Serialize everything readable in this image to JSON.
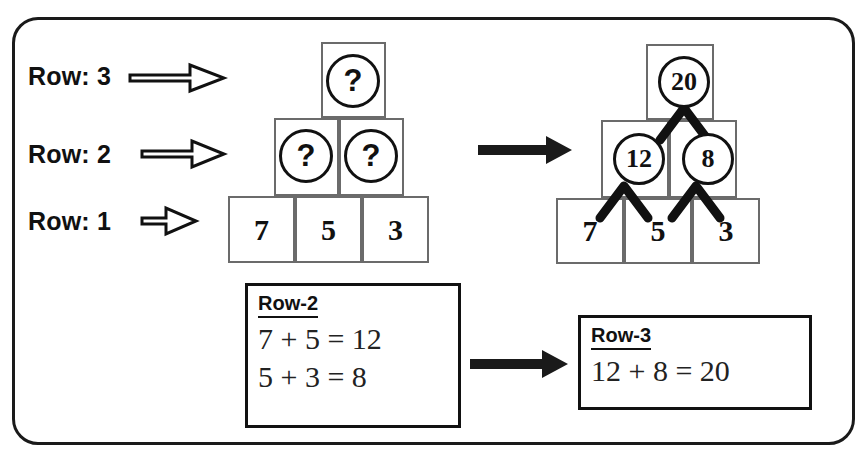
{
  "frame": {
    "label": "worksheet-frame"
  },
  "row_labels": [
    {
      "text": "Row: 3"
    },
    {
      "text": "Row: 2"
    },
    {
      "text": "Row: 1"
    }
  ],
  "pyramid_left": {
    "caption": "unsolved-pyramid",
    "row3": [
      {
        "value": "?"
      }
    ],
    "row2": [
      {
        "value": "?"
      },
      {
        "value": "?"
      }
    ],
    "row1": [
      {
        "value": "7"
      },
      {
        "value": "5"
      },
      {
        "value": "3"
      }
    ]
  },
  "pyramid_right": {
    "caption": "solved-pyramid",
    "row3": [
      {
        "value": "20"
      }
    ],
    "row2": [
      {
        "value": "12"
      },
      {
        "value": "8"
      }
    ],
    "row1": [
      {
        "value": "7"
      },
      {
        "value": "5"
      },
      {
        "value": "3"
      }
    ]
  },
  "equation_box_row2": {
    "title": "Row-2",
    "lines": [
      "7 + 5 = 12",
      "5 + 3 = 8"
    ]
  },
  "equation_box_row3": {
    "title": "Row-3",
    "lines": [
      "12 + 8 = 20"
    ]
  },
  "arrows": {
    "pyramid_transform": "arrow-right",
    "equation_transform": "arrow-right",
    "row_pointer": "hollow-arrow-right"
  },
  "colors": {
    "ink": "#111111",
    "cell_border": "#6b6b6b",
    "frame": "#1a1a1a",
    "paper": "#ffffff"
  }
}
